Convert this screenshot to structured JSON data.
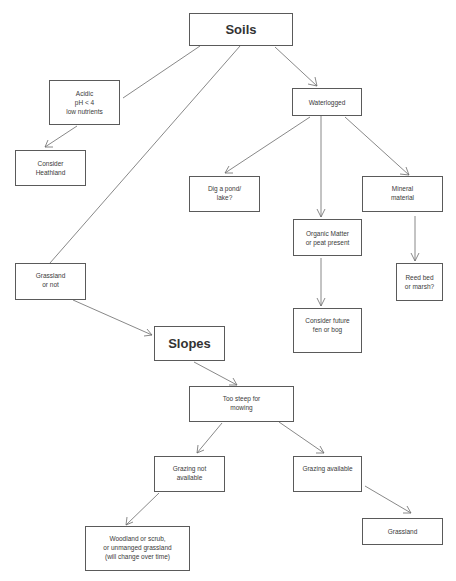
{
  "diagram": {
    "type": "flowchart",
    "nodes": {
      "soils": {
        "lines": [
          "Soils"
        ]
      },
      "acidic": {
        "lines": [
          "Acidic",
          "pH < 4",
          "low nutrients"
        ]
      },
      "heathland": {
        "lines": [
          "Consider",
          "Heathland"
        ]
      },
      "waterlogged": {
        "lines": [
          "Waterlogged"
        ]
      },
      "pond": {
        "lines": [
          "Dig a pond/",
          "lake?"
        ]
      },
      "mineral": {
        "lines": [
          "Mineral",
          "material"
        ]
      },
      "organic": {
        "lines": [
          "Organic Matter",
          "or peat present"
        ]
      },
      "reedbed": {
        "lines": [
          "Reed bed",
          "or marsh?"
        ]
      },
      "fen": {
        "lines": [
          "Consider future",
          "fen or bog"
        ]
      },
      "grassland_or_not": {
        "lines": [
          "Grassland",
          "or not"
        ]
      },
      "slopes": {
        "lines": [
          "Slopes"
        ]
      },
      "too_steep": {
        "lines": [
          "Too steep for",
          "mowing"
        ]
      },
      "grazing_not": {
        "lines": [
          "Grazing not",
          "available"
        ]
      },
      "grazing_avail": {
        "lines": [
          "Grazing available"
        ]
      },
      "woodland": {
        "lines": [
          "Woodland or scrub,",
          "or unmanged grassland",
          "(will change over time)"
        ]
      },
      "grassland": {
        "lines": [
          "Grassland"
        ]
      }
    },
    "edges": [
      {
        "from": "soils",
        "to": "acidic",
        "arrow": false
      },
      {
        "from": "soils",
        "to": "grassland_or_not",
        "arrow": false
      },
      {
        "from": "soils",
        "to": "waterlogged",
        "arrow": true
      },
      {
        "from": "acidic",
        "to": "heathland",
        "arrow": true
      },
      {
        "from": "waterlogged",
        "to": "pond",
        "arrow": true
      },
      {
        "from": "waterlogged",
        "to": "organic",
        "arrow": true
      },
      {
        "from": "waterlogged",
        "to": "mineral",
        "arrow": true
      },
      {
        "from": "mineral",
        "to": "reedbed",
        "arrow": true
      },
      {
        "from": "organic",
        "to": "fen",
        "arrow": true
      },
      {
        "from": "grassland_or_not",
        "to": "slopes",
        "arrow": true
      },
      {
        "from": "slopes",
        "to": "too_steep",
        "arrow": true
      },
      {
        "from": "too_steep",
        "to": "grazing_not",
        "arrow": true
      },
      {
        "from": "too_steep",
        "to": "grazing_avail",
        "arrow": true
      },
      {
        "from": "grazing_not",
        "to": "woodland",
        "arrow": true
      },
      {
        "from": "grazing_avail",
        "to": "grassland",
        "arrow": true
      }
    ],
    "colors": {
      "stroke": "#5a5a5a",
      "text": "#3a3a3a",
      "background": "#ffffff"
    }
  }
}
